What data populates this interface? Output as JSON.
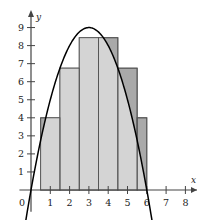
{
  "figure": {
    "name": "midpoint-riemann-sum-parabola",
    "axis_labels": {
      "x": "x",
      "y": "y"
    },
    "origin_label": "0",
    "x_ticks": [
      1,
      2,
      3,
      4,
      5,
      6,
      7,
      8
    ],
    "y_ticks": [
      1,
      2,
      3,
      4,
      5,
      6,
      7,
      8,
      9
    ],
    "colors": {
      "bar_fill_light": "#d4d4d4",
      "bar_fill_dark": "#a9a9a9",
      "bar_stroke": "#555555",
      "curve": "#000000",
      "axis": "#444444",
      "background": "#ffffff"
    }
  },
  "chart_data": {
    "type": "bar",
    "title": "",
    "xlabel": "x",
    "ylabel": "y",
    "xlim": [
      -0.6,
      8.7
    ],
    "ylim": [
      -1.3,
      9.8
    ],
    "grid": false,
    "legend": null,
    "categories": [
      "0.5",
      "1.5",
      "2.5",
      "3.5",
      "4.5",
      "5.5"
    ],
    "bar_intervals": [
      [
        0.5,
        1.5
      ],
      [
        1.5,
        2.5
      ],
      [
        2.5,
        3.5
      ],
      [
        3.5,
        4.5
      ],
      [
        4.5,
        5.5
      ],
      [
        5.5,
        6.0
      ]
    ],
    "values": [
      4,
      6.75,
      8.4375,
      8.4375,
      6.75,
      4
    ],
    "bar_edges": [
      0.5,
      1.5,
      2.5,
      3.5,
      4.5,
      5.5,
      6.5
    ],
    "bar_width": 1,
    "series": [
      {
        "name": "midpoint rectangles",
        "values": [
          4,
          6.75,
          8.4375,
          8.4375,
          6.75,
          4
        ]
      },
      {
        "name": "y = x(6 - x)",
        "type": "line",
        "x": [
          0,
          0.5,
          1,
          1.5,
          2,
          2.5,
          3,
          3.5,
          4,
          4.5,
          5,
          5.5,
          6
        ],
        "y": [
          0,
          2.75,
          5,
          6.75,
          8,
          8.75,
          9,
          8.75,
          8,
          6.75,
          5,
          2.75,
          0
        ],
        "vertex": [
          3,
          9
        ],
        "roots": [
          0,
          6
        ]
      }
    ]
  }
}
